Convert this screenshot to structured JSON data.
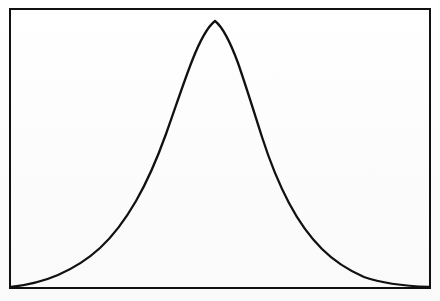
{
  "figure": {
    "title": "",
    "caption": "",
    "background_color": "#fdfdfd",
    "ink_color": "#111111"
  },
  "frame": {
    "name": "plot-frame",
    "x": 10,
    "y": 9,
    "width": 420,
    "height": 279,
    "stroke_width": 2,
    "stroke_color": "#111111",
    "fill": "none"
  },
  "curve": {
    "name": "bell-curve",
    "stroke_width": 2.3,
    "stroke_color": "#111111",
    "peak_x": 215,
    "peak_y": 10,
    "left_endpoint": [
      11,
      287
    ],
    "right_endpoint": [
      429,
      287
    ],
    "sigma_px": 78,
    "path": "M 11 287 C 28 285 44 281 58 275 C 74 268 88 259 100 248 C 113 236 125 220 136 201 C 147 182 157 159 166 134 C 175 109 183 84 192 61 C 199 43 206 28 215 21 C 224 28 231 44 238 63 C 246 86 254 112 262 137 C 270 162 279 184 289 203 C 299 222 310 237 322 249 C 334 261 348 270 364 277 C 381 283 404 286 429 287"
  },
  "chart_data": {
    "type": "line",
    "xlabel": "",
    "ylabel": "",
    "grid": false,
    "legend": false,
    "axis_ticks": false,
    "xlim": [
      0,
      1
    ],
    "ylim": [
      0,
      1
    ],
    "distribution": {
      "shape": "bell",
      "mean_normalized": 0.488,
      "sigma_normalized": 0.186,
      "peak_value_normalized": 1.0,
      "skew": "slight-right"
    },
    "series": [
      {
        "name": "density",
        "x": [
          0.0,
          0.05,
          0.1,
          0.15,
          0.2,
          0.25,
          0.3,
          0.35,
          0.4,
          0.45,
          0.488,
          0.5,
          0.55,
          0.6,
          0.65,
          0.7,
          0.75,
          0.8,
          0.85,
          0.9,
          0.95,
          1.0
        ],
        "y": [
          0.0,
          0.03,
          0.06,
          0.11,
          0.18,
          0.29,
          0.44,
          0.62,
          0.82,
          0.96,
          1.0,
          0.99,
          0.93,
          0.8,
          0.63,
          0.46,
          0.31,
          0.2,
          0.12,
          0.07,
          0.03,
          0.0
        ]
      }
    ],
    "annotations": []
  }
}
